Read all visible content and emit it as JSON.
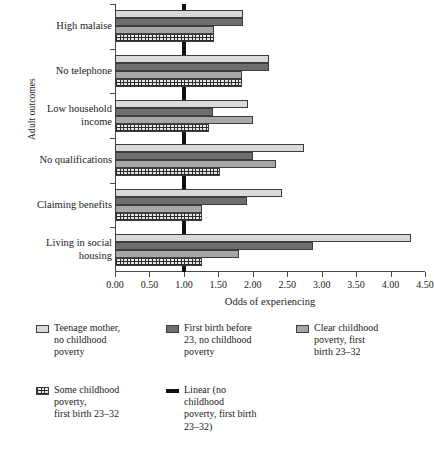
{
  "chart_data": {
    "type": "bar",
    "orientation": "horizontal",
    "title": "",
    "xlabel": "Odds of experiencing",
    "ylabel": "Adult outcomes",
    "xlim": [
      0.0,
      4.5
    ],
    "xticks": [
      "0.00",
      "0.50",
      "1.00",
      "1.50",
      "2.00",
      "2.50",
      "3.00",
      "3.50",
      "4.00",
      "4.50"
    ],
    "xtick_values": [
      0.0,
      0.5,
      1.0,
      1.5,
      2.0,
      2.5,
      3.0,
      3.5,
      4.0,
      4.5
    ],
    "grid": false,
    "legend_position": "below",
    "reference_line": {
      "value": 1.0,
      "label": "Linear (no childhood poverty, first birth 23–32)"
    },
    "categories": [
      "High malaise",
      "No telephone",
      "Low household\nincome",
      "No qualifications",
      "Claiming benefits",
      "Living in social\nhousing"
    ],
    "series": [
      {
        "name": "Teenage mother, no childhood poverty",
        "style": "light-gray",
        "values": [
          1.86,
          2.23,
          1.93,
          2.74,
          2.42,
          4.3
        ]
      },
      {
        "name": "First birth before 23, no childhood poverty",
        "style": "dark-gray",
        "values": [
          1.86,
          2.23,
          1.42,
          2.0,
          1.91,
          2.88
        ]
      },
      {
        "name": "Clear childhood poverty, first birth 23–32",
        "style": "mid-gray",
        "values": [
          1.44,
          1.84,
          2.0,
          2.33,
          1.27,
          1.8
        ]
      },
      {
        "name": "Some childhood poverty, first birth 23–32",
        "style": "hatched",
        "values": [
          1.44,
          1.84,
          1.36,
          1.52,
          1.27,
          1.27
        ]
      }
    ]
  },
  "legend": {
    "items": [
      {
        "label": "Teenage mother,\nno childhood\npoverty",
        "swatch": "light-gray"
      },
      {
        "label": "First birth before\n23, no childhood\npoverty",
        "swatch": "dark-gray"
      },
      {
        "label": "Clear childhood\npoverty, first\nbirth 23–32",
        "swatch": "mid-gray"
      },
      {
        "label": "Some childhood\npoverty,\nfirst birth 23–32",
        "swatch": "hatched"
      },
      {
        "label": "Linear (no\nchildhood\npoverty, first birth\n23–32)",
        "swatch": "line"
      }
    ]
  },
  "colors": {
    "light_gray": "#d9d9d9",
    "dark_gray": "#6e6e6e",
    "mid_gray": "#a6a6a6",
    "hatch_fg": "#2b2b2b",
    "hatch_bg": "#e8e8e8",
    "line": "#101010",
    "axis": "#4a4a4a"
  },
  "caption": ""
}
